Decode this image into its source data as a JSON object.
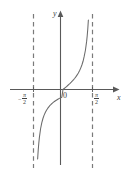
{
  "figure": {
    "title": "",
    "axis_labels": {
      "x": "x",
      "y": "y",
      "origin": "0"
    },
    "tick_labels": {
      "left_minus": "−",
      "left_numerator": "π",
      "left_denominator": "2",
      "right_numerator": "π",
      "right_denominator": "2"
    },
    "colors": {
      "axis": "#595959",
      "curve": "#6b6b6b",
      "asymptote": "#7a7a7a",
      "background": "#ffffff",
      "text": "#404040"
    }
  },
  "chart_data": {
    "type": "line",
    "title": "",
    "xlabel": "x",
    "ylabel": "y",
    "function": "y = tan(x)",
    "xlim": [
      -1.9634954,
      1.9634954
    ],
    "ylim": [
      -4.6,
      4.6
    ],
    "grid": false,
    "legend": null,
    "asymptotes": [
      {
        "type": "vertical",
        "x": -1.5707963,
        "label": "-π/2",
        "style": "dashed"
      },
      {
        "type": "vertical",
        "x": 1.5707963,
        "label": "π/2",
        "style": "dashed"
      }
    ],
    "xticks": [
      -1.5707963,
      0,
      1.5707963
    ],
    "xticklabels": [
      "-π/2",
      "0",
      "π/2"
    ],
    "annotations": [
      {
        "text": "0",
        "x": 0,
        "y": 0,
        "position": "below-right-of-origin"
      },
      {
        "text": "x",
        "x": 1.9,
        "y": -0.5,
        "position": "end-of-x-axis"
      },
      {
        "text": "y",
        "x": -0.12,
        "y": 4.4,
        "position": "top-of-y-axis"
      }
    ],
    "series": [
      {
        "name": "y = tan(x)",
        "x": [
          -1.4137167,
          -1.3823008,
          -1.350885,
          -1.319469,
          -1.2880531,
          -1.2566371,
          -1.1938052,
          -1.1309734,
          -1.0681415,
          -1.0053096,
          -0.9424778,
          -0.8796459,
          -0.8168141,
          -0.7539822,
          -0.6911504,
          -0.6283185,
          -0.5654867,
          -0.5026548,
          -0.439823,
          -0.3769911,
          -0.3141593,
          -0.2513274,
          -0.1884956,
          -0.1256637,
          -0.0628319,
          0.0,
          0.0628319,
          0.1256637,
          0.1884956,
          0.2513274,
          0.3141593,
          0.3769911,
          0.439823,
          0.5026548,
          0.5654867,
          0.6283185,
          0.6911504,
          0.7539822,
          0.8168141,
          0.8796459,
          0.9424778,
          1.0053096,
          1.0681415,
          1.1309734,
          1.1938052,
          1.2566371,
          1.2880531,
          1.319469,
          1.350885,
          1.3823008,
          1.4137167
        ],
        "y": [
          -6.3138,
          -5.2422,
          -4.4737,
          -3.8947,
          -3.442,
          -3.0777,
          -2.5257,
          -2.1445,
          -1.865,
          -1.6499,
          -1.4779,
          -1.3364,
          -1.2174,
          -1.1154,
          -1.0265,
          -0.948,
          -0.878,
          -0.815,
          -0.7578,
          -0.7055,
          -0.6575,
          -0.6131,
          -0.5719,
          -0.5332,
          -0.4968,
          0.0,
          0.0629,
          0.1263,
          0.1908,
          0.2568,
          0.3249,
          0.3959,
          0.4706,
          0.5498,
          0.6346,
          0.7265,
          0.8273,
          0.9391,
          1.0649,
          1.2087,
          1.3764,
          1.5757,
          1.8165,
          2.1445,
          2.5257,
          3.0777,
          3.442,
          3.8947,
          4.4737,
          5.2422,
          6.3138
        ]
      }
    ]
  }
}
